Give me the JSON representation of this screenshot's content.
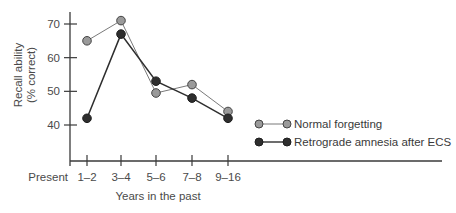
{
  "chart_data": {
    "type": "line",
    "title": "",
    "xlabel": "Years in the past",
    "ylabel": "Recall ability (% correct)",
    "ylabel_lines": [
      "Recall ability",
      "(% correct)"
    ],
    "x_origin_label": "Present",
    "categories": [
      "1–2",
      "3–4",
      "5–6",
      "7–8",
      "9–16"
    ],
    "yticks": [
      40,
      50,
      60,
      70
    ],
    "ylim": [
      30,
      74
    ],
    "grid": false,
    "legend_position": "right",
    "series": [
      {
        "name": "Normal forgetting",
        "color": "#9a9a9a",
        "values": [
          65,
          71,
          49.5,
          52,
          44
        ]
      },
      {
        "name": "Retrograde amnesia after ECS",
        "color": "#2e2e2e",
        "values": [
          42,
          67,
          53,
          48,
          42
        ]
      }
    ]
  }
}
